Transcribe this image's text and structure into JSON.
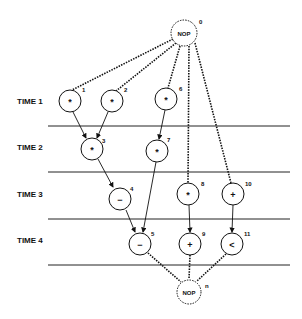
{
  "diagram": {
    "time_labels": [
      "TIME 1",
      "TIME 2",
      "TIME 3",
      "TIME 4"
    ],
    "nodes": [
      {
        "id": "0",
        "label": "NOP",
        "x": 184,
        "y": 33,
        "kind": "nop"
      },
      {
        "id": "1",
        "label": "*",
        "x": 70,
        "y": 101,
        "kind": "op"
      },
      {
        "id": "2",
        "label": "*",
        "x": 112,
        "y": 101,
        "kind": "op"
      },
      {
        "id": "6",
        "label": "*",
        "x": 166,
        "y": 99,
        "kind": "op"
      },
      {
        "id": "3",
        "label": "*",
        "x": 92,
        "y": 149,
        "kind": "op"
      },
      {
        "id": "7",
        "label": "*",
        "x": 157,
        "y": 151,
        "kind": "op"
      },
      {
        "id": "4",
        "label": "−",
        "x": 120,
        "y": 199,
        "kind": "op"
      },
      {
        "id": "8",
        "label": "*",
        "x": 188,
        "y": 194,
        "kind": "op"
      },
      {
        "id": "10",
        "label": "+",
        "x": 233,
        "y": 194,
        "kind": "op"
      },
      {
        "id": "5",
        "label": "−",
        "x": 140,
        "y": 244,
        "kind": "op"
      },
      {
        "id": "9",
        "label": "+",
        "x": 190,
        "y": 244,
        "kind": "op"
      },
      {
        "id": "11",
        "label": "<",
        "x": 232,
        "y": 244,
        "kind": "op"
      },
      {
        "id": "n",
        "label": "NOP",
        "x": 189,
        "y": 292,
        "kind": "nop"
      }
    ]
  }
}
